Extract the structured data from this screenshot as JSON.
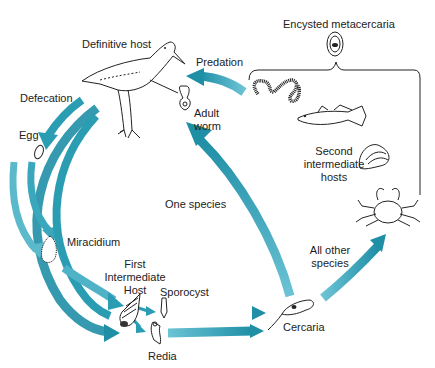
{
  "diagram": {
    "colors": {
      "arrow_dark": "#1f8fa6",
      "arrow_light": "#6cc3d5",
      "ink": "#222222",
      "background": "#ffffff"
    },
    "labels": {
      "definitive_host": "Definitive host",
      "predation": "Predation",
      "encysted_metacercaria": "Encysted metacercaria",
      "defecation": "Defecation",
      "egg": "Egg",
      "adult_worm_1": "Adult",
      "adult_worm_2": "worm",
      "second_host_1": "Second",
      "second_host_2": "intermediate",
      "second_host_3": "hosts",
      "one_species": "One species",
      "miracidium": "Miracidium",
      "first_host_1": "First",
      "first_host_2": "Intermediate",
      "first_host_3": "Host",
      "sporocyst": "Sporocyst",
      "all_other_1": "All other",
      "all_other_2": "species",
      "cercaria": "Cercaria",
      "redia": "Redia"
    },
    "stages": [
      {
        "name": "Adult worm",
        "host": "Definitive host"
      },
      {
        "name": "Egg",
        "via": "Defecation"
      },
      {
        "name": "Miracidium"
      },
      {
        "name": "Sporocyst",
        "host": "First Intermediate Host"
      },
      {
        "name": "Redia",
        "host": "First Intermediate Host"
      },
      {
        "name": "Cercaria"
      },
      {
        "name": "Encysted metacercaria",
        "host": "Second intermediate hosts"
      }
    ],
    "transitions": [
      {
        "from": "Definitive host",
        "to": "Egg",
        "label": "Defecation"
      },
      {
        "from": "Egg",
        "to": "Miracidium"
      },
      {
        "from": "Miracidium",
        "to": "First Intermediate Host"
      },
      {
        "from": "First Intermediate Host",
        "to": "Sporocyst"
      },
      {
        "from": "First Intermediate Host",
        "to": "Redia"
      },
      {
        "from": "Sporocyst",
        "to": "Cercaria"
      },
      {
        "from": "Redia",
        "to": "Cercaria"
      },
      {
        "from": "Cercaria",
        "to": "Definitive host",
        "label": "One species"
      },
      {
        "from": "Cercaria",
        "to": "Second intermediate hosts",
        "label": "All other species"
      },
      {
        "from": "Second intermediate hosts",
        "to": "Definitive host",
        "label": "Predation"
      }
    ]
  }
}
